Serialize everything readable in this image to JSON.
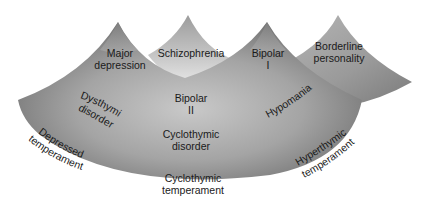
{
  "diagram": {
    "type": "mood-disorder-spectrum-landscape",
    "peaks": [
      {
        "id": "major-depression",
        "label_lines": [
          "Major",
          "depression"
        ]
      },
      {
        "id": "schizophrenia",
        "label_lines": [
          "Schizophrenia"
        ]
      },
      {
        "id": "bipolar-i",
        "label_lines": [
          "Bipolar",
          "I"
        ]
      },
      {
        "id": "borderline-personality",
        "label_lines": [
          "Borderline",
          "personality"
        ]
      }
    ],
    "inner_labels": {
      "dysthymic_disorder": "Dysthymic disorder",
      "dysthymic_line1": "Dysthymic",
      "dysthymic_line2": "disorder",
      "bipolar_ii_line1": "Bipolar",
      "bipolar_ii_line2": "II",
      "hypomania": "Hypomania",
      "cyclothymic_disorder_line1": "Cyclothymic",
      "cyclothymic_disorder_line2": "disorder"
    },
    "base_labels": {
      "depressed_line1": "Depressed",
      "depressed_line2": "temperament",
      "cyclothymic_line1": "Cyclothymic",
      "cyclothymic_line2": "temperament",
      "hyperthymic_line1": "Hyperthymic",
      "hyperthymic_line2": "temperament"
    },
    "colors": {
      "shape_dark": "#6e6e6e",
      "shape_mid": "#9a9a9a",
      "shape_light": "#d6d6d6",
      "text": "#1a1a1a",
      "background": "#ffffff"
    }
  }
}
